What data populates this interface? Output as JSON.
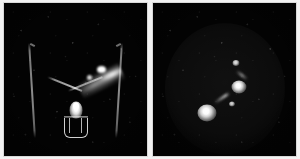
{
  "figure": {
    "kind": "nuclear-medicine-scintigraphy-image-pair",
    "background_color": "#f2f2f2",
    "panel_background_color": "#030303",
    "hotspot_color": "#ffffff",
    "panels": [
      {
        "id": "panel-left",
        "position": "left",
        "view": "anterior pelvis",
        "background_color": "#030303",
        "features": [
          {
            "name": "body-outline-left-flank",
            "kind": "faint-contour-line"
          },
          {
            "name": "body-outline-right-flank",
            "kind": "faint-contour-line"
          },
          {
            "name": "fallopian-arm-left",
            "kind": "linear-tracer-track"
          },
          {
            "name": "fallopian-arm-right",
            "kind": "linear-tracer-track"
          },
          {
            "name": "uterine-cavity-hotspot",
            "kind": "bright-focus"
          },
          {
            "name": "applicator-cage",
            "kind": "device-outline"
          },
          {
            "name": "tracer-spill-streak",
            "kind": "diffuse-uptake-streak"
          }
        ]
      },
      {
        "id": "panel-right",
        "position": "right",
        "view": "delayed / magnified",
        "background_color": "#030303",
        "features": [
          {
            "name": "soft-tissue-halo",
            "kind": "faint-dome-contour"
          },
          {
            "name": "focus-lower-left",
            "kind": "bright-focus"
          },
          {
            "name": "focus-mid",
            "kind": "bright-focus"
          },
          {
            "name": "focus-upper",
            "kind": "bright-focus"
          },
          {
            "name": "focus-small",
            "kind": "bright-focus"
          },
          {
            "name": "connecting-tail",
            "kind": "linear-tracer-track"
          },
          {
            "name": "connecting-wisp",
            "kind": "linear-tracer-track"
          }
        ]
      }
    ]
  }
}
